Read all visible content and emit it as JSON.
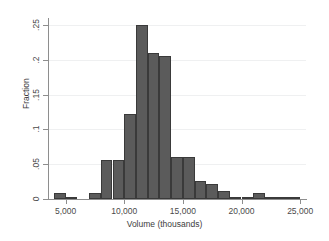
{
  "chart_data": {
    "type": "bar",
    "title": "",
    "subtitle": "",
    "xlabel": "Volume (thousands)",
    "ylabel": "Fraction",
    "xlim": [
      3500,
      25500
    ],
    "ylim": [
      0,
      0.26
    ],
    "grid": true,
    "legend": null,
    "bin_width": 1000,
    "xtick_labels": [
      "5,000",
      "10,000",
      "15,000",
      "20,000",
      "25,000"
    ],
    "xtick_values": [
      5000,
      10000,
      15000,
      20000,
      25000
    ],
    "ytick_labels": [
      "0",
      ".05",
      ".1",
      ".15",
      ".2",
      ".25"
    ],
    "ytick_values": [
      0,
      0.05,
      0.1,
      0.15,
      0.2,
      0.25
    ],
    "bar_color": "#5b5b5b",
    "bar_edge_color": "#3a3a3a",
    "gridline_color": "#eff0f1",
    "axis_color": "#8e8e8e",
    "bins": [
      {
        "left": 4000,
        "right": 5000,
        "center": 4500,
        "value": 0.008
      },
      {
        "left": 5000,
        "right": 6000,
        "center": 5500,
        "value": 0.003
      },
      {
        "left": 6000,
        "right": 7000,
        "center": 6500,
        "value": 0.0
      },
      {
        "left": 7000,
        "right": 8000,
        "center": 7500,
        "value": 0.008
      },
      {
        "left": 8000,
        "right": 9000,
        "center": 8500,
        "value": 0.056
      },
      {
        "left": 9000,
        "right": 10000,
        "center": 9500,
        "value": 0.056
      },
      {
        "left": 10000,
        "right": 11000,
        "center": 10500,
        "value": 0.122
      },
      {
        "left": 11000,
        "right": 12000,
        "center": 11500,
        "value": 0.25
      },
      {
        "left": 12000,
        "right": 13000,
        "center": 12500,
        "value": 0.21
      },
      {
        "left": 13000,
        "right": 14000,
        "center": 13500,
        "value": 0.205
      },
      {
        "left": 14000,
        "right": 15000,
        "center": 14500,
        "value": 0.06
      },
      {
        "left": 15000,
        "right": 16000,
        "center": 15500,
        "value": 0.06
      },
      {
        "left": 16000,
        "right": 17000,
        "center": 16500,
        "value": 0.026
      },
      {
        "left": 17000,
        "right": 18000,
        "center": 17500,
        "value": 0.021
      },
      {
        "left": 18000,
        "right": 19000,
        "center": 18500,
        "value": 0.012
      },
      {
        "left": 19000,
        "right": 20000,
        "center": 19500,
        "value": 0.003
      },
      {
        "left": 20000,
        "right": 21000,
        "center": 20500,
        "value": 0.003
      },
      {
        "left": 21000,
        "right": 22000,
        "center": 21500,
        "value": 0.008
      },
      {
        "left": 22000,
        "right": 23000,
        "center": 22500,
        "value": 0.002
      },
      {
        "left": 23000,
        "right": 24000,
        "center": 23500,
        "value": 0.002
      },
      {
        "left": 24000,
        "right": 25000,
        "center": 24500,
        "value": 0.003
      }
    ]
  }
}
